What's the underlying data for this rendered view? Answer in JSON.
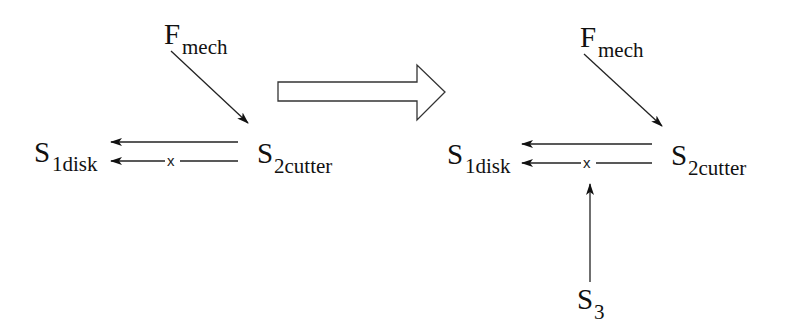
{
  "diagram": {
    "colors": {
      "line": "#222222",
      "text": "#111111",
      "background": "#ffffff",
      "transition_arrow_fill": "#ffffff"
    },
    "before": {
      "force": {
        "main": "F",
        "sub": "mech"
      },
      "source": {
        "main": "S",
        "sub": "2cutter"
      },
      "target": {
        "main": "S",
        "sub": "1disk"
      },
      "blocked_marker": "x",
      "edges": [
        {
          "from": "F_mech",
          "to": "S_2cutter",
          "type": "arrow"
        },
        {
          "from": "S_2cutter",
          "to": "S_1disk",
          "type": "arrow"
        },
        {
          "from": "S_2cutter",
          "to": "S_1disk",
          "type": "arrow-blocked",
          "marker": "x"
        }
      ]
    },
    "transition": {
      "icon": "hollow-right-arrow-icon"
    },
    "after": {
      "force": {
        "main": "F",
        "sub": "mech"
      },
      "source": {
        "main": "S",
        "sub": "2cutter"
      },
      "target": {
        "main": "S",
        "sub": "1disk"
      },
      "added": {
        "main": "S",
        "sub": "3"
      },
      "blocked_marker": "x",
      "edges": [
        {
          "from": "F_mech",
          "to": "S_2cutter",
          "type": "arrow"
        },
        {
          "from": "S_2cutter",
          "to": "S_1disk",
          "type": "arrow"
        },
        {
          "from": "S_2cutter",
          "to": "S_1disk",
          "type": "arrow-blocked",
          "marker": "x"
        },
        {
          "from": "S_3",
          "to": "blocked-edge",
          "type": "arrow"
        }
      ]
    }
  }
}
